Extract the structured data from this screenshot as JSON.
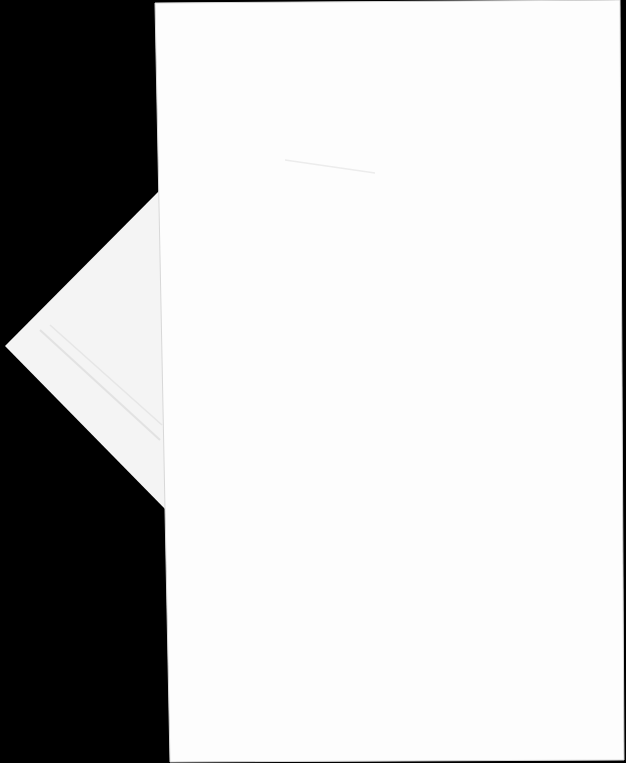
{
  "scene": {
    "description": "Photograph of a blank white sheet of paper with a folded triangular flap on a black background",
    "colors": {
      "background": "#000000",
      "paper": "#fdfdfd",
      "flap": "#f4f4f4",
      "flap_shade": "#e9e9e9",
      "edge": "#d8d8d8"
    },
    "paper_polygon": "155,3 620,0 624,760 170,762",
    "flap_polygon": "160,190 5,346 166,510",
    "crease_lines": [
      {
        "x1": 40,
        "y1": 330,
        "x2": 160,
        "y2": 440
      },
      {
        "x1": 50,
        "y1": 325,
        "x2": 162,
        "y2": 425
      }
    ],
    "smudge_line": {
      "x1": 285,
      "y1": 160,
      "x2": 375,
      "y2": 173
    }
  }
}
